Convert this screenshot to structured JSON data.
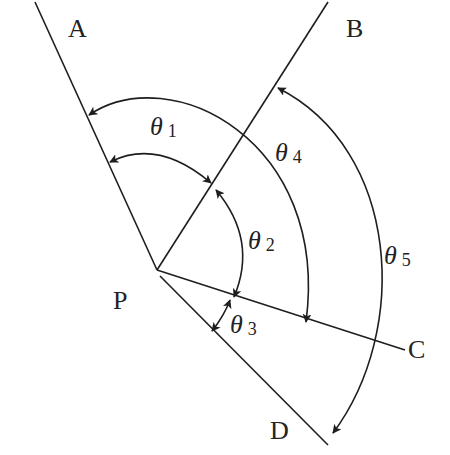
{
  "diagram": {
    "title": "",
    "type": "angle-diagram",
    "vertex": {
      "label": "P",
      "x": 157,
      "y": 270
    },
    "rays": [
      {
        "id": "A",
        "label": "A",
        "end": [
          35,
          2
        ]
      },
      {
        "id": "B",
        "label": "B",
        "end": [
          328,
          2
        ]
      },
      {
        "id": "C",
        "label": "C",
        "end": [
          405,
          350
        ]
      },
      {
        "id": "D",
        "label": "D",
        "end": [
          328,
          445
        ]
      }
    ],
    "angles": [
      {
        "id": "theta1",
        "symbol": "θ",
        "index": "1",
        "between": [
          "A",
          "B"
        ],
        "arrows": "both"
      },
      {
        "id": "theta2",
        "symbol": "θ",
        "index": "2",
        "between": [
          "B",
          "C"
        ],
        "arrows": "both"
      },
      {
        "id": "theta3",
        "symbol": "θ",
        "index": "3",
        "between": [
          "C",
          "D"
        ],
        "arrows": "both"
      },
      {
        "id": "theta4",
        "symbol": "θ",
        "index": "4",
        "between": [
          "A",
          "C"
        ],
        "arrows": "both"
      },
      {
        "id": "theta5",
        "symbol": "θ",
        "index": "5",
        "between": [
          "B",
          "D"
        ],
        "arrows": "both"
      }
    ],
    "colors": {
      "ink": "#1e1e1e",
      "background": "#ffffff"
    }
  }
}
